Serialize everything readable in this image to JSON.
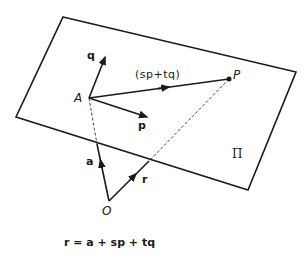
{
  "diagram": {
    "labels": {
      "q": "q",
      "p": "p",
      "A": "A",
      "P": "P",
      "a": "a",
      "r": "r",
      "O": "O",
      "plane": "Π",
      "sp_tq": "(sp+tq)"
    },
    "equation": "r = a + sp + tq",
    "colors": {
      "stroke": "#1a1a1a",
      "background": "#ffffff"
    }
  }
}
